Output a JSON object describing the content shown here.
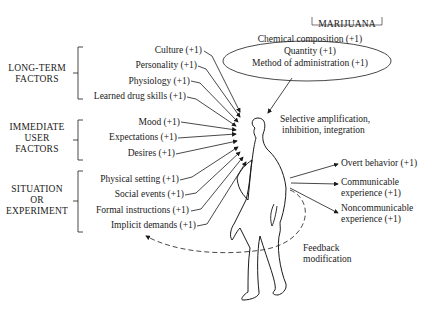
{
  "diagram": {
    "drug": {
      "title": "MARIJUANA",
      "factors": [
        "Chemical composition (+1)",
        "Quantity (+1)",
        "Method of administration (+1)"
      ]
    },
    "groups": [
      {
        "label_lines": [
          "LONG-TERM",
          "FACTORS"
        ],
        "factors": [
          "Culture (+1)",
          "Personality (+1)",
          "Physiology (+1)",
          "Learned drug skills (+1)"
        ]
      },
      {
        "label_lines": [
          "IMMEDIATE",
          "USER",
          "FACTORS"
        ],
        "factors": [
          "Mood (+1)",
          "Expectations (+1)",
          "Desires (+1)"
        ]
      },
      {
        "label_lines": [
          "SITUATION",
          "OR",
          "EXPERIMENT"
        ],
        "factors": [
          "Physical setting (+1)",
          "Social events (+1)",
          "Formal instructions (+1)",
          "Implicit demands (+1)"
        ]
      }
    ],
    "process": [
      "Selective amplification,",
      "inhibition, integration"
    ],
    "outputs": [
      {
        "lines": [
          "Overt behavior (+1)"
        ]
      },
      {
        "lines": [
          "Communicable",
          "experience (+1)"
        ]
      },
      {
        "lines": [
          "Noncommunicable",
          "experience (+1)"
        ]
      }
    ],
    "feedback": [
      "Feedback",
      "modification"
    ]
  }
}
